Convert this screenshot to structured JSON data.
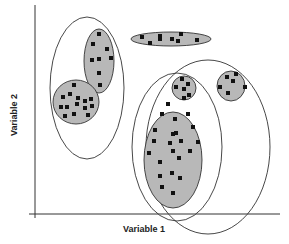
{
  "diagram": {
    "type": "cluster-scatter",
    "x_axis_label": "Variable 1",
    "y_axis_label": "Variable 2",
    "colors": {
      "cluster_fill": "#b8b8b8",
      "outline": "#333333",
      "point": "#111111",
      "axis": "#333333"
    },
    "clusters": [
      {
        "id": "upper-left",
        "cx": 99,
        "cy": 61,
        "rx": 15,
        "ry": 32,
        "points": [
          [
            99,
            34
          ],
          [
            93,
            44
          ],
          [
            107,
            49
          ],
          [
            92,
            60
          ],
          [
            99,
            59
          ],
          [
            111,
            58
          ],
          [
            99,
            73
          ],
          [
            100,
            85
          ]
        ]
      },
      {
        "id": "lower-left",
        "cx": 76,
        "cy": 102,
        "rx": 23,
        "ry": 22,
        "points": [
          [
            74,
            85
          ],
          [
            63,
            97
          ],
          [
            70,
            94
          ],
          [
            78,
            98
          ],
          [
            85,
            101
          ],
          [
            91,
            99
          ],
          [
            61,
            107
          ],
          [
            67,
            107
          ],
          [
            77,
            104
          ],
          [
            85,
            108
          ],
          [
            92,
            106
          ],
          [
            65,
            116
          ],
          [
            74,
            114
          ],
          [
            88,
            115
          ]
        ]
      },
      {
        "id": "top-elongated",
        "cx": 171,
        "cy": 39,
        "rx": 40,
        "ry": 7,
        "points": [
          [
            142,
            37
          ],
          [
            150,
            43
          ],
          [
            160,
            36
          ],
          [
            160,
            39
          ],
          [
            172,
            39
          ],
          [
            181,
            34
          ],
          [
            178,
            41
          ],
          [
            197,
            40
          ]
        ]
      },
      {
        "id": "small-center",
        "cx": 184,
        "cy": 88,
        "rx": 12,
        "ry": 12,
        "points": [
          [
            182,
            79
          ],
          [
            188,
            84
          ],
          [
            176,
            87
          ],
          [
            184,
            89
          ],
          [
            189,
            95
          ],
          [
            184,
            98
          ]
        ]
      },
      {
        "id": "small-right",
        "cx": 231,
        "cy": 86,
        "rx": 14,
        "ry": 15,
        "points": [
          [
            227,
            77
          ],
          [
            236,
            74
          ],
          [
            233,
            81
          ],
          [
            220,
            87
          ],
          [
            245,
            87
          ],
          [
            228,
            93
          ]
        ]
      },
      {
        "id": "large-center",
        "cx": 173,
        "cy": 160,
        "rx": 29,
        "ry": 48,
        "points": [
          [
            168,
            104
          ],
          [
            162,
            114
          ],
          [
            175,
            119
          ],
          [
            188,
            114
          ],
          [
            193,
            127
          ],
          [
            155,
            130
          ],
          [
            173,
            134
          ],
          [
            176,
            133
          ],
          [
            154,
            141
          ],
          [
            170,
            143
          ],
          [
            181,
            141
          ],
          [
            198,
            142
          ],
          [
            149,
            153
          ],
          [
            173,
            151
          ],
          [
            190,
            151
          ],
          [
            179,
            158
          ],
          [
            160,
            162
          ],
          [
            172,
            173
          ],
          [
            160,
            176
          ],
          [
            180,
            178
          ],
          [
            162,
            187
          ],
          [
            173,
            193
          ]
        ]
      }
    ],
    "outer_groups": [
      {
        "id": "left-outer",
        "cx": 87,
        "cy": 88,
        "rx": 37,
        "ry": 71
      },
      {
        "id": "center-outer",
        "cx": 177,
        "cy": 147,
        "rx": 45,
        "ry": 74
      },
      {
        "id": "right-outer",
        "cx": 208,
        "cy": 147,
        "rx": 62,
        "ry": 87
      }
    ]
  }
}
